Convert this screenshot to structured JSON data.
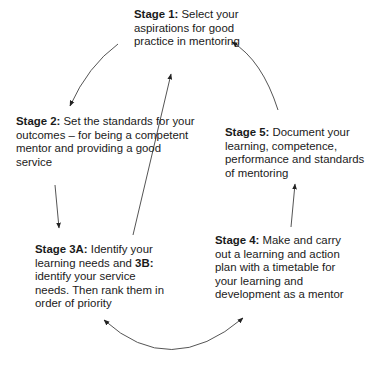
{
  "diagram": {
    "type": "cycle",
    "stages": [
      {
        "id": "1",
        "label": "Stage 1:",
        "text": " Select your aspirations for good practice in mentoring"
      },
      {
        "id": "2",
        "label": "Stage 2:",
        "text": " Set the standards for your outcomes – for being a competent mentor and providing a good service"
      },
      {
        "id": "3",
        "label": "Stage 3A:",
        "text": " Identify your learning needs and ",
        "label_b": "3B:",
        "text_b": " identify your service needs. Then rank them in order of priority"
      },
      {
        "id": "4",
        "label": "Stage 4:",
        "text": " Make and carry out a learning and action plan with a timetable for your learning and development as a mentor"
      },
      {
        "id": "5",
        "label": "Stage 5:",
        "text": " Document your learning, competence, performance and standards of mentoring"
      }
    ],
    "connections": [
      {
        "from": "1",
        "to": "2",
        "direction": "single"
      },
      {
        "from": "2",
        "to": "3",
        "direction": "single"
      },
      {
        "from": "3",
        "to": "1",
        "direction": "single"
      },
      {
        "from": "3",
        "to": "4",
        "direction": "double"
      },
      {
        "from": "4",
        "to": "5",
        "direction": "single"
      },
      {
        "from": "5",
        "to": "1",
        "direction": "single"
      }
    ],
    "colors": {
      "text": "#1a1a1a",
      "arrow": "#555555"
    }
  }
}
